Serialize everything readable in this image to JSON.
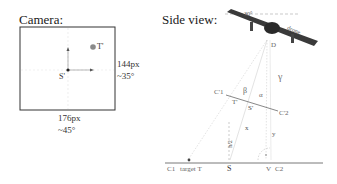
{
  "camera_panel": {
    "title": "Camera:",
    "width_px_label": "176px",
    "width_angle_label": "~45°",
    "height_px_label": "144px",
    "height_angle_label": "~35°",
    "point_labels": {
      "target": "T'",
      "center": "S'"
    }
  },
  "side_view_panel": {
    "title": "Side view:",
    "drone_label": "drone",
    "tilt_label": "30°",
    "point_labels": {
      "drone": "D",
      "c1_prime": "C'1",
      "c2_prime": "C'2",
      "t_prime": "T'",
      "s_prime": "S'",
      "c1": "C1",
      "target": "target T",
      "s": "S",
      "v": "V",
      "c2": "C2"
    },
    "angle_labels": {
      "alpha": "α",
      "beta": "β",
      "gamma": "γ"
    },
    "segment_labels": {
      "x": "x",
      "y": "y",
      "h": "h/2"
    }
  },
  "colors": {
    "frame": "#333333",
    "ground": "#555555",
    "construction": "#c8c8c8",
    "drone_body": "#3a3a3a",
    "target_dot": "#888888"
  }
}
